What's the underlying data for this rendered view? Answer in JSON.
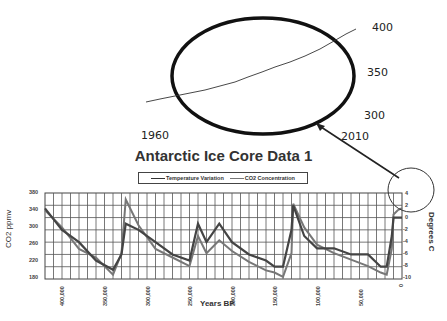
{
  "inset": {
    "labels": {
      "y400": "400",
      "y350": "350",
      "y300": "300",
      "x1960": "1960",
      "x2010": "2010"
    },
    "description": "Zoomed Keeling curve (1960-2010) inside highlighted ellipse with arrow to recent data"
  },
  "chart_data": {
    "type": "line",
    "title": "Antarctic Ice Core Data 1",
    "xlabel": "Years BP",
    "ylabel": "CO2 ppmv",
    "y2label": "Degrees C",
    "x_ticks": [
      "400,000",
      "350,000",
      "300,000",
      "250,000",
      "200,000",
      "150,000",
      "100,000",
      "50,000",
      "0"
    ],
    "y_ticks": [
      "380",
      "340",
      "300",
      "260",
      "220",
      "180"
    ],
    "y2_ticks": [
      "4",
      "2",
      "0",
      "-2",
      "-4",
      "-6",
      "-8",
      "-10"
    ],
    "ylim": [
      180,
      380
    ],
    "y2lim": [
      -10,
      4
    ],
    "xlim": [
      420000,
      0
    ],
    "legend": [
      "Temperature Variation",
      "CO2 Concentration"
    ],
    "legend_position": "top",
    "grid": true,
    "x": [
      420000,
      400000,
      380000,
      360000,
      340000,
      330000,
      325000,
      310000,
      290000,
      270000,
      250000,
      240000,
      230000,
      215000,
      200000,
      180000,
      160000,
      150000,
      140000,
      130000,
      128000,
      115000,
      100000,
      80000,
      60000,
      40000,
      25000,
      18000,
      12000,
      10000,
      5000,
      0
    ],
    "series": [
      {
        "name": "Temperature Variation",
        "values": [
          1.5,
          -2,
          -4,
          -7,
          -8.5,
          -6,
          -1,
          -2,
          -4,
          -6,
          -7,
          -1,
          -4,
          -1,
          -4,
          -6,
          -7,
          -8,
          -8,
          -2,
          2,
          -3,
          -5,
          -5,
          -6,
          -6,
          -8,
          -8,
          -3,
          0,
          0,
          0
        ]
      },
      {
        "name": "CO2 Concentration",
        "values": [
          340,
          300,
          250,
          230,
          190,
          240,
          365,
          305,
          250,
          230,
          210,
          280,
          240,
          270,
          245,
          220,
          200,
          195,
          185,
          240,
          355,
          300,
          260,
          240,
          225,
          210,
          195,
          190,
          250,
          330,
          340,
          345
        ]
      }
    ],
    "annotations": [
      {
        "type": "ellipse",
        "target": "recent data (0 years BP)",
        "note": "Small circle around latest values with arrow to inset"
      },
      {
        "type": "inset",
        "title": "1960-2010 CO2",
        "x_labels": [
          "1960",
          "2010"
        ],
        "y_labels": [
          "300",
          "350",
          "400"
        ],
        "values_approx": [
          317,
          390
        ]
      }
    ]
  }
}
